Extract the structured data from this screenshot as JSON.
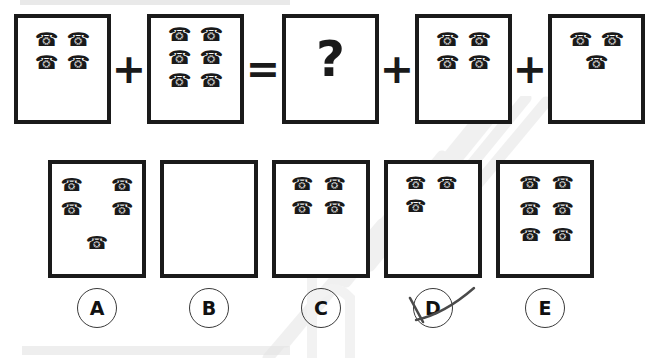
{
  "worksheet": {
    "type": "picture-addition-equation",
    "icon_glyph": "☎",
    "icon_name": "telephone-icon"
  },
  "equation": {
    "operators": {
      "plus": "+",
      "equals": "=",
      "unknown": "?"
    },
    "terms": [
      {
        "id": "term-1",
        "name": "addend-1",
        "count": 4,
        "rows": [
          2,
          2
        ]
      },
      {
        "id": "operator-plus-1",
        "name": "plus-operator",
        "symbol": "+"
      },
      {
        "id": "term-2",
        "name": "addend-2",
        "count": 6,
        "rows": [
          2,
          2,
          2
        ]
      },
      {
        "id": "operator-equals",
        "name": "equals-operator",
        "symbol": "="
      },
      {
        "id": "term-3",
        "name": "unknown-answer-box",
        "count": 0,
        "rows": [],
        "symbol": "?"
      },
      {
        "id": "operator-plus-2",
        "name": "plus-operator",
        "symbol": "+"
      },
      {
        "id": "term-4",
        "name": "addend-3",
        "count": 4,
        "rows": [
          2,
          2
        ]
      },
      {
        "id": "operator-plus-3",
        "name": "plus-operator",
        "symbol": "+"
      },
      {
        "id": "term-5",
        "name": "addend-4",
        "count": 3,
        "rows": [
          2,
          1
        ]
      }
    ]
  },
  "options": [
    {
      "letter": "A",
      "count": 5,
      "rows": [
        2,
        2,
        1
      ],
      "selected": false
    },
    {
      "letter": "B",
      "count": 0,
      "rows": [],
      "selected": false
    },
    {
      "letter": "C",
      "count": 4,
      "rows": [
        2,
        2
      ],
      "selected": false
    },
    {
      "letter": "D",
      "count": 3,
      "rows": [
        2,
        1
      ],
      "selected": true
    },
    {
      "letter": "E",
      "count": 6,
      "rows": [
        2,
        2,
        2
      ],
      "selected": false
    }
  ],
  "colors": {
    "ink": "#1a1a1a",
    "circle_stroke": "#3a3a3a",
    "pen_mark": "#4a4a4a",
    "paper": "#ffffff",
    "scan_bar": "#ededed",
    "watermark": "#e3e3e3"
  }
}
